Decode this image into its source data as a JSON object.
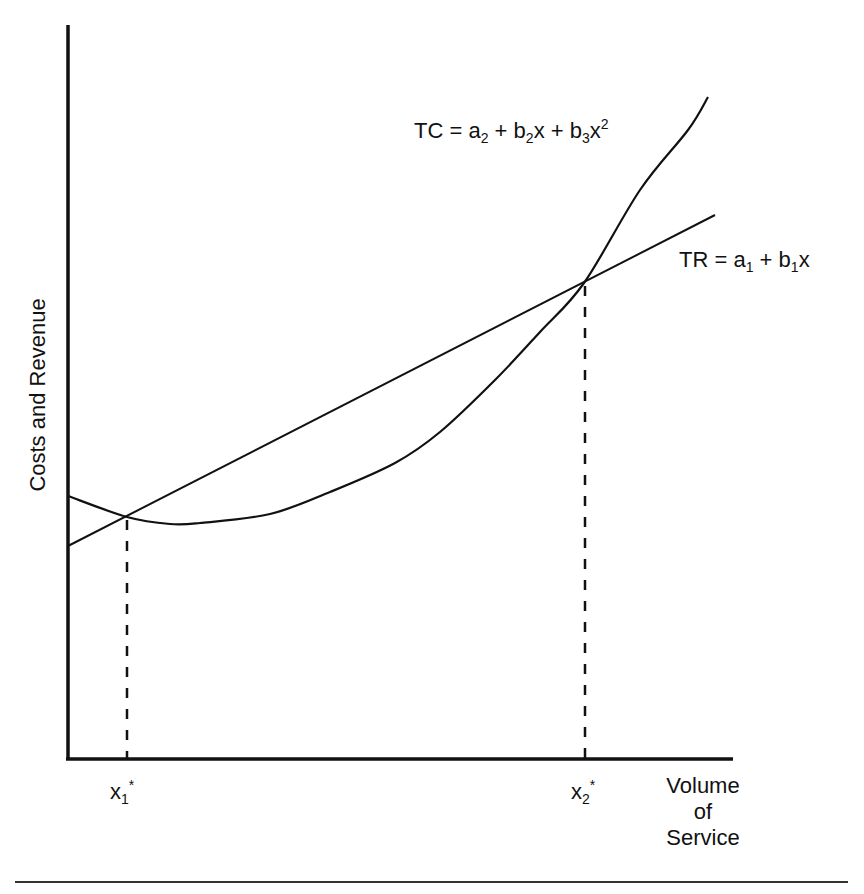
{
  "chart_data": {
    "type": "line",
    "title": "",
    "xlabel": "Volume of Service",
    "xlabel_lines": [
      "Volume",
      "of",
      "Service"
    ],
    "ylabel": "Costs and Revenue",
    "grid": false,
    "legend": "inline labels",
    "series": [
      {
        "name": "TC",
        "label_parts": {
          "lhs": "TC",
          "eq": "=",
          "t1": "a",
          "t1s": "2",
          "p1": "+",
          "t2": "b",
          "t2s": "2",
          "t2x": "x",
          "p2": "+",
          "t3": "b",
          "t3s": "3",
          "t3x": "x",
          "t3e": "2"
        },
        "label": "TC = a2 + b2x + b3x^2",
        "shape": "quadratic (U-shaped)",
        "points_px": [
          [
            68,
            496
          ],
          [
            127,
            517
          ],
          [
            170,
            524
          ],
          [
            200,
            523
          ],
          [
            270,
            514
          ],
          [
            330,
            492
          ],
          [
            395,
            463
          ],
          [
            440,
            432
          ],
          [
            495,
            380
          ],
          [
            540,
            332
          ],
          [
            584,
            283
          ],
          [
            640,
            190
          ],
          [
            688,
            130
          ],
          [
            708,
            97
          ]
        ]
      },
      {
        "name": "TR",
        "label_parts": {
          "lhs": "TR",
          "eq": "=",
          "t1": "a",
          "t1s": "1",
          "p1": "+",
          "t2": "b",
          "t2s": "1",
          "t2x": "x"
        },
        "label": "TR = a1 + b1x",
        "shape": "linear",
        "points_px": [
          [
            68,
            546
          ],
          [
            715,
            215
          ]
        ]
      }
    ],
    "annotations": [
      {
        "text": "x1*",
        "base": "x",
        "sub": "1",
        "sup": "*",
        "at_px": [
          127,
          759
        ],
        "meaning": "lower break-even volume"
      },
      {
        "text": "x2*",
        "base": "x",
        "sub": "2",
        "sup": "*",
        "at_px": [
          585,
          759
        ],
        "meaning": "upper break-even volume"
      }
    ],
    "intersections_px": [
      [
        127,
        517
      ],
      [
        584,
        283
      ]
    ],
    "axes_px": {
      "origin": [
        68,
        759
      ],
      "y_top": 25,
      "x_right": 733
    }
  }
}
